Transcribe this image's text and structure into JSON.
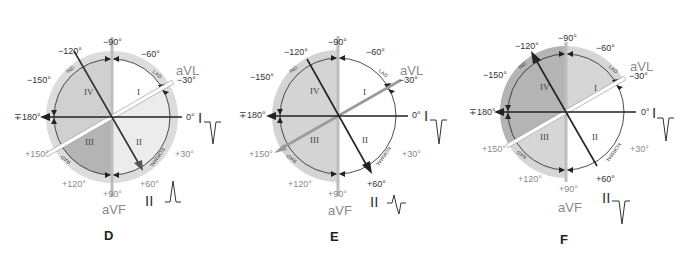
{
  "figure": {
    "panels": [
      {
        "id": "D",
        "letter": "D",
        "center": [
          112,
          117
        ],
        "outer_shade": "#d8d8d8",
        "quadrant_fill": {
          "I": "#ffffff",
          "II": "#ececec",
          "III": "#b0b0b0",
          "IV": "#cfcfcf"
        },
        "lead_I_waveform": "negative",
        "lead_II_waveform": "positive",
        "arrows": {
          "lead_I": "to_180",
          "lead_II": "to_+60",
          "aVL": "none"
        },
        "aVL_style": "double_white"
      },
      {
        "id": "E",
        "letter": "E",
        "center": [
          338,
          116
        ],
        "outer_shade": "#d8d8d8",
        "quadrant_fill": {
          "I": "#ffffff",
          "II": "#ffffff",
          "III": "#d0d0d0",
          "IV": "#d0d0d0"
        },
        "lead_I_waveform": "negative",
        "lead_II_waveform": "biphasic",
        "arrows": {
          "lead_I": "to_180",
          "lead_II": "to_+60",
          "aVL": "to_+150"
        },
        "aVL_style": "solid_gray"
      },
      {
        "id": "F",
        "letter": "F",
        "center": [
          566,
          112
        ],
        "outer_shade": "#d8d8d8",
        "quadrant_fill": {
          "I": "#d6d6d6",
          "II": "#ffffff",
          "III": "#d6d6d6",
          "IV": "#b0b0b0"
        },
        "lead_I_waveform": "negative",
        "lead_II_waveform": "negative",
        "arrows": {
          "lead_I": "to_180",
          "lead_II": "to_-120",
          "aVL": "none"
        },
        "aVL_style": "double_white"
      }
    ],
    "labels": {
      "deg_minus90": "−90°",
      "deg_minus120": "−120°",
      "deg_minus60": "−60°",
      "deg_minus150": "−150°",
      "deg_minus30": "−30°",
      "deg_180": "∓180°",
      "deg_0": "0°",
      "deg_plus150": "+150°",
      "deg_plus30": "+30°",
      "deg_plus120": "+120°",
      "deg_plus60": "+60°",
      "deg_plus90": "+90°",
      "lead_aVL": "aVL",
      "lead_aVF": "aVF",
      "lead_I": "I",
      "lead_II": "II",
      "quad_I": "I",
      "quad_II": "II",
      "quad_III": "III",
      "quad_IV": "IV",
      "arc_IND": "IND",
      "arc_LAD": "LAD",
      "arc_RAD": "RAD",
      "arc_NORMAL": "NORMAL"
    }
  }
}
